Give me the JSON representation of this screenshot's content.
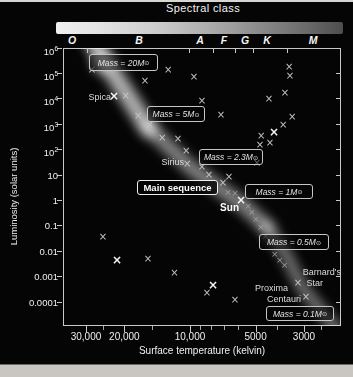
{
  "figure": {
    "spectral_class_title": "Spectral class",
    "x_axis_label": "Surface temperature (kelvin)",
    "y_axis_label": "Luminosity (solar units)"
  },
  "colors": {
    "background": "#050505",
    "page_edge": "#c9c6c2",
    "text": "#efefef",
    "frame": "#c8c8c8",
    "band_glow": "#ffffff",
    "marker": "#c6c6c6",
    "gradient_bar_left": "#f0f0f0",
    "gradient_bar_right": "#4e4e4e"
  },
  "chart_data": {
    "type": "scatter",
    "title": "Spectral class",
    "xlabel": "Surface temperature (kelvin)",
    "ylabel": "Luminosity (solar units)",
    "x_scale": "log reversed",
    "y_scale": "log",
    "xlim_kelvin": [
      38000,
      2000
    ],
    "ylim_solar": [
      1e-05,
      1000000
    ],
    "grid": false,
    "marker_glyph": "×",
    "spectral_classes": [
      {
        "label": "O",
        "x": 72
      },
      {
        "label": "B",
        "x": 139
      },
      {
        "label": "A",
        "x": 200
      },
      {
        "label": "F",
        "x": 224
      },
      {
        "label": "G",
        "x": 245
      },
      {
        "label": "K",
        "x": 267
      },
      {
        "label": "M",
        "x": 313
      }
    ],
    "class_boundaries_px": [
      87,
      189,
      213,
      235,
      253,
      287
    ],
    "y_ticks": [
      {
        "base": "10",
        "exp": "6",
        "value": 1000000
      },
      {
        "base": "10",
        "exp": "5",
        "value": 100000
      },
      {
        "base": "10",
        "exp": "4",
        "value": 10000
      },
      {
        "base": "10",
        "exp": "3",
        "value": 1000
      },
      {
        "base": "10",
        "exp": "2",
        "value": 100
      },
      {
        "base": "10",
        "exp": "",
        "value": 10
      },
      {
        "base": "1",
        "exp": "",
        "value": 1
      },
      {
        "base": "0.1",
        "exp": "",
        "value": 0.1
      },
      {
        "base": "0.01",
        "exp": "",
        "value": 0.01
      },
      {
        "base": "0.001",
        "exp": "",
        "value": 0.001
      },
      {
        "base": "0.0001",
        "exp": "",
        "value": 0.0001
      }
    ],
    "x_ticks": [
      {
        "label": "30,000",
        "t": 30000
      },
      {
        "label": "20,000",
        "t": 20000
      },
      {
        "label": "10,000",
        "t": 10000
      },
      {
        "label": "5000",
        "t": 5000
      },
      {
        "label": "3000",
        "t": 3000
      }
    ],
    "x_minor_ticks": [
      25000,
      15000,
      9000,
      8000,
      7000,
      6000,
      4000,
      2500
    ],
    "points": [
      {
        "t": 28200,
        "l": 140000,
        "s": "n"
      },
      {
        "t": 22300,
        "l": 13000,
        "s": "b",
        "star": "Spica"
      },
      {
        "t": 19700,
        "l": 13000,
        "s": "n"
      },
      {
        "t": 17300,
        "l": 2100,
        "s": "n"
      },
      {
        "t": 15300,
        "l": 930,
        "s": "n"
      },
      {
        "t": 13400,
        "l": 290,
        "s": "n"
      },
      {
        "t": 11350,
        "l": 260,
        "s": "n"
      },
      {
        "t": 10400,
        "l": 88,
        "s": "n"
      },
      {
        "t": 10300,
        "l": 27,
        "s": "n",
        "star": "Sirius"
      },
      {
        "t": 8810,
        "l": 21,
        "s": "n"
      },
      {
        "t": 8180,
        "l": 10,
        "s": "n"
      },
      {
        "t": 6620,
        "l": 8.3,
        "s": "n"
      },
      {
        "t": 7060,
        "l": 4.8,
        "s": "n"
      },
      {
        "t": 6700,
        "l": 2.1,
        "s": "f"
      },
      {
        "t": 6220,
        "l": 2.0,
        "s": "f"
      },
      {
        "t": 5830,
        "l": 1.0,
        "s": "b",
        "star": "Sun"
      },
      {
        "t": 5420,
        "l": 0.62,
        "s": "f"
      },
      {
        "t": 5210,
        "l": 0.35,
        "s": "f"
      },
      {
        "t": 4990,
        "l": 0.18,
        "s": "f"
      },
      {
        "t": 4740,
        "l": 0.087,
        "s": "f"
      },
      {
        "t": 4500,
        "l": 0.039,
        "s": "f"
      },
      {
        "t": 4080,
        "l": 0.0077,
        "s": "f"
      },
      {
        "t": 3870,
        "l": 0.0045,
        "s": "f"
      },
      {
        "t": 3680,
        "l": 0.0028,
        "s": "f"
      },
      {
        "t": 3200,
        "l": 0.00056,
        "s": "n",
        "star": "Barnard's Star"
      },
      {
        "t": 2940,
        "l": 0.00016,
        "s": "n",
        "star": "Proxima Centauri"
      },
      {
        "t": 16100,
        "l": 50000,
        "s": "n"
      },
      {
        "t": 12600,
        "l": 140000,
        "s": "n"
      },
      {
        "t": 9590,
        "l": 72000,
        "s": "n"
      },
      {
        "t": 8810,
        "l": 8200,
        "s": "n"
      },
      {
        "t": 7210,
        "l": 2300,
        "s": "n"
      },
      {
        "t": 4340,
        "l": 9800,
        "s": "n"
      },
      {
        "t": 3670,
        "l": 17000,
        "s": "n"
      },
      {
        "t": 3510,
        "l": 180000,
        "s": "n"
      },
      {
        "t": 3480,
        "l": 79000,
        "s": "n"
      },
      {
        "t": 3400,
        "l": 1900,
        "s": "n"
      },
      {
        "t": 3740,
        "l": 930,
        "s": "n"
      },
      {
        "t": 4120,
        "l": 490,
        "s": "b"
      },
      {
        "t": 4720,
        "l": 340,
        "s": "n"
      },
      {
        "t": 4780,
        "l": 150,
        "s": "n"
      },
      {
        "t": 4300,
        "l": 180,
        "s": "n"
      },
      {
        "t": 4930,
        "l": 30,
        "s": "n"
      },
      {
        "t": 25100,
        "l": 0.036,
        "s": "n"
      },
      {
        "t": 21600,
        "l": 0.0045,
        "s": "b"
      },
      {
        "t": 15600,
        "l": 0.0049,
        "s": "n"
      },
      {
        "t": 11800,
        "l": 0.0014,
        "s": "n"
      },
      {
        "t": 7840,
        "l": 0.00047,
        "s": "b"
      },
      {
        "t": 8350,
        "l": 0.00023,
        "s": "n"
      },
      {
        "t": 6220,
        "l": 0.00012,
        "s": "n"
      }
    ],
    "annotations": [
      {
        "text": "Mass = 20",
        "unit": "M",
        "sun": "⊙",
        "x": 89,
        "y": 54,
        "w": 69,
        "h": 17
      },
      {
        "text": "Mass = 5",
        "unit": "M",
        "sun": "⊙",
        "x": 147,
        "y": 106,
        "w": 58,
        "h": 16
      },
      {
        "text": "Mass = 2.3",
        "unit": "M",
        "sun": "⊙",
        "x": 199,
        "y": 149,
        "w": 64,
        "h": 16
      },
      {
        "text": "Main sequence",
        "style": "title",
        "x": 137,
        "y": 180,
        "w": 81,
        "h": 15
      },
      {
        "text": "Mass = 1",
        "unit": "M",
        "sun": "⊙",
        "x": 245,
        "y": 184,
        "w": 68,
        "h": 15
      },
      {
        "text": "Mass = 0.5",
        "unit": "M",
        "sun": "⊙",
        "x": 259,
        "y": 234,
        "w": 70,
        "h": 16
      },
      {
        "text": "Mass = 0.1",
        "unit": "M",
        "sun": "⊙",
        "x": 266,
        "y": 306,
        "w": 68,
        "h": 15
      }
    ],
    "star_labels": [
      {
        "lines": [
          "Spica"
        ],
        "x": 111,
        "y": 92,
        "indent": [
          0
        ]
      },
      {
        "lines": [
          "Sirius"
        ],
        "x": 184,
        "y": 157,
        "indent": [
          0
        ]
      },
      {
        "lines": [
          "Sun"
        ],
        "x": 239,
        "y": 203,
        "indent": [
          0
        ],
        "bold": true
      },
      {
        "lines": [
          "Barnard's",
          "Star"
        ],
        "x": 341,
        "y": 267,
        "indent": [
          0,
          18
        ]
      },
      {
        "lines": [
          "Proxima",
          "Centauri"
        ],
        "x": 301,
        "y": 283,
        "indent": [
          13,
          0
        ]
      }
    ]
  }
}
